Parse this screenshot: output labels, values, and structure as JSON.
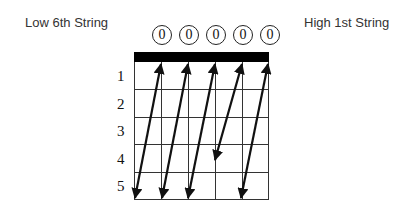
{
  "labels": {
    "low_string": "Low 6th String",
    "high_string": "High 1st String"
  },
  "open_markers": [
    "0",
    "0",
    "0",
    "0",
    "0"
  ],
  "fret_numbers": [
    "1",
    "2",
    "3",
    "4",
    "5"
  ],
  "diagram": {
    "type": "guitar-fretboard",
    "strings": 6,
    "frets": 5,
    "nut": true,
    "arrows": [
      {
        "from": {
          "string": 5,
          "fret": 0
        },
        "to": {
          "string": 6,
          "fret": 5
        }
      },
      {
        "from": {
          "string": 4,
          "fret": 0
        },
        "to": {
          "string": 5,
          "fret": 5
        }
      },
      {
        "from": {
          "string": 3,
          "fret": 0
        },
        "to": {
          "string": 4,
          "fret": 5
        }
      },
      {
        "from": {
          "string": 2,
          "fret": 0
        },
        "to": {
          "string": 3,
          "fret": 4
        }
      },
      {
        "from": {
          "string": 1,
          "fret": 0
        },
        "to": {
          "string": 2,
          "fret": 5
        }
      }
    ]
  },
  "colors": {
    "line": "#222222",
    "nut": "#000000",
    "text": "#333333"
  }
}
